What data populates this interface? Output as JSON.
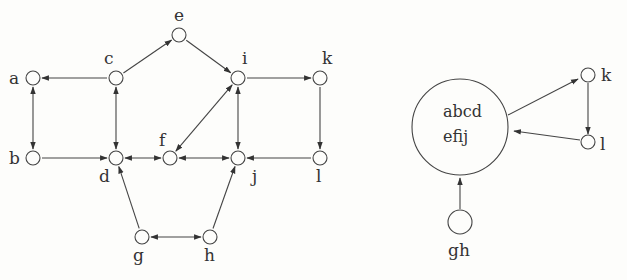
{
  "left_graph": {
    "nodes": [
      {
        "id": "a",
        "x": 33,
        "y": 78,
        "label": "a",
        "lx": 9,
        "ly": 84
      },
      {
        "id": "b",
        "x": 33,
        "y": 158,
        "label": "b",
        "lx": 9,
        "ly": 164
      },
      {
        "id": "c",
        "x": 116,
        "y": 78,
        "label": "c",
        "lx": 104,
        "ly": 64
      },
      {
        "id": "d",
        "x": 116,
        "y": 158,
        "label": "d",
        "lx": 99,
        "ly": 182
      },
      {
        "id": "e",
        "x": 179,
        "y": 35,
        "label": "e",
        "lx": 174,
        "ly": 21
      },
      {
        "id": "f",
        "x": 170,
        "y": 158,
        "label": "f",
        "lx": 159,
        "ly": 146
      },
      {
        "id": "i",
        "x": 238,
        "y": 78,
        "label": "i",
        "lx": 242,
        "ly": 64
      },
      {
        "id": "j",
        "x": 238,
        "y": 158,
        "label": "j",
        "lx": 252,
        "ly": 182
      },
      {
        "id": "k",
        "x": 320,
        "y": 78,
        "label": "k",
        "lx": 322,
        "ly": 64
      },
      {
        "id": "l",
        "x": 320,
        "y": 158,
        "label": "l",
        "lx": 316,
        "ly": 182
      },
      {
        "id": "g",
        "x": 142,
        "y": 237,
        "label": "g",
        "lx": 133,
        "ly": 261
      },
      {
        "id": "h",
        "x": 210,
        "y": 237,
        "label": "h",
        "lx": 204,
        "ly": 261
      }
    ],
    "edges": [
      {
        "from": "c",
        "to": "a",
        "bidirectional": false
      },
      {
        "from": "c",
        "to": "e",
        "bidirectional": false
      },
      {
        "from": "e",
        "to": "i",
        "bidirectional": false
      },
      {
        "from": "i",
        "to": "k",
        "bidirectional": false
      },
      {
        "from": "a",
        "to": "b",
        "bidirectional": true
      },
      {
        "from": "c",
        "to": "d",
        "bidirectional": true
      },
      {
        "from": "i",
        "to": "j",
        "bidirectional": true
      },
      {
        "from": "i",
        "to": "f",
        "bidirectional": true
      },
      {
        "from": "k",
        "to": "l",
        "bidirectional": false
      },
      {
        "from": "b",
        "to": "d",
        "bidirectional": false
      },
      {
        "from": "d",
        "to": "f",
        "bidirectional": true
      },
      {
        "from": "f",
        "to": "j",
        "bidirectional": true
      },
      {
        "from": "l",
        "to": "j",
        "bidirectional": false
      },
      {
        "from": "g",
        "to": "d",
        "bidirectional": false
      },
      {
        "from": "h",
        "to": "j",
        "bidirectional": false
      },
      {
        "from": "g",
        "to": "h",
        "bidirectional": true
      }
    ]
  },
  "condensed_graph": {
    "big_node": {
      "line1": "abcd",
      "line2": "efij"
    },
    "nodes": [
      {
        "id": "k",
        "label": "k"
      },
      {
        "id": "l",
        "label": "l"
      },
      {
        "id": "gh",
        "label": "gh"
      }
    ],
    "edges": [
      {
        "from": "abcdefij",
        "to": "k"
      },
      {
        "from": "k",
        "to": "l"
      },
      {
        "from": "l",
        "to": "abcdefij"
      },
      {
        "from": "gh",
        "to": "abcdefij"
      }
    ]
  }
}
